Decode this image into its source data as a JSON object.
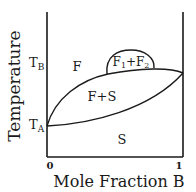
{
  "diagram": {
    "type": "binary phase diagram",
    "y_axis_label": "Temperature",
    "x_axis_label": "Mole Fraction B",
    "x_ticks": [
      "0",
      "1"
    ],
    "y_ticks": {
      "t_b": {
        "main": "T",
        "sub": "B"
      },
      "t_a": {
        "main": "T",
        "sub": "A"
      }
    },
    "regions": {
      "fluid": "F",
      "two_fluid": {
        "f1": "F",
        "s1": "1",
        "plus": "+",
        "f2": "F",
        "s2": "2"
      },
      "fluid_solid": "F+S",
      "solid": "S"
    },
    "line_color": "#1a1a1a"
  }
}
